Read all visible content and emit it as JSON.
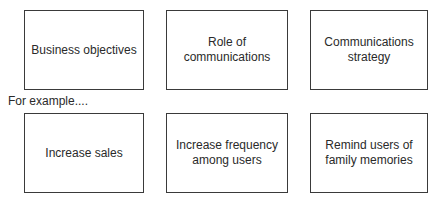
{
  "top_row": [
    {
      "label": "Business objectives"
    },
    {
      "label": "Role of\ncommunications"
    },
    {
      "label": "Communications\nstrategy"
    }
  ],
  "example_label": "For example....",
  "bottom_row": [
    {
      "label": "Increase sales"
    },
    {
      "label": "Increase frequency\namong users"
    },
    {
      "label": "Remind users of\nfamily memories"
    }
  ]
}
